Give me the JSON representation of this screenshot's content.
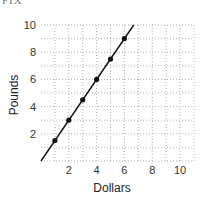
{
  "header": {
    "cropped_label": "FIX"
  },
  "chart_data": {
    "type": "line",
    "title": "",
    "xlabel": "Dollars",
    "ylabel": "Pounds",
    "xlim": [
      0,
      11
    ],
    "ylim": [
      0,
      10
    ],
    "x_ticks": [
      2,
      4,
      6,
      8,
      10
    ],
    "y_ticks": [
      2,
      4,
      6,
      8,
      10
    ],
    "grid": true,
    "grid_step": 1,
    "grid_style": "dotted",
    "legend": null,
    "series": [
      {
        "name": "Pounds vs Dollars",
        "line": {
          "from": [
            0,
            0
          ],
          "to": [
            6.67,
            10
          ]
        },
        "points": [
          {
            "x": 1,
            "y": 1.5
          },
          {
            "x": 2,
            "y": 3
          },
          {
            "x": 3,
            "y": 4.5
          },
          {
            "x": 4,
            "y": 6
          },
          {
            "x": 5,
            "y": 7.5
          },
          {
            "x": 6,
            "y": 9
          }
        ],
        "color": "#111111"
      }
    ]
  }
}
